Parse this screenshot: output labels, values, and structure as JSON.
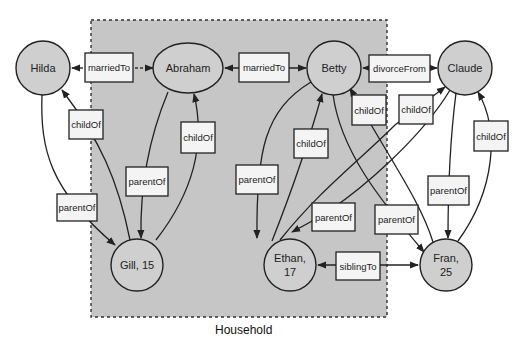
{
  "diagram": {
    "group": {
      "label": "Household",
      "fill": "#c6c6c6"
    },
    "node_fill": "#cfcfcf",
    "nodes": [
      {
        "id": "hilda",
        "lines": [
          "Hilda"
        ]
      },
      {
        "id": "abraham",
        "lines": [
          "Abraham"
        ]
      },
      {
        "id": "betty",
        "lines": [
          "Betty"
        ]
      },
      {
        "id": "claude",
        "lines": [
          "Claude"
        ]
      },
      {
        "id": "gill",
        "lines": [
          "Gill, 15"
        ]
      },
      {
        "id": "ethan",
        "lines": [
          "Ethan,",
          "17"
        ]
      },
      {
        "id": "fran",
        "lines": [
          "Fran,",
          "25"
        ]
      }
    ],
    "edges": [
      {
        "id": "e1",
        "from": "abraham",
        "to": "hilda",
        "label": "marriedTo",
        "style": "dashed",
        "bidirectional": true
      },
      {
        "id": "e2",
        "from": "abraham",
        "to": "betty",
        "label": "marriedTo",
        "style": "solid",
        "bidirectional": true
      },
      {
        "id": "e3",
        "from": "betty",
        "to": "claude",
        "label": "divorceFrom",
        "style": "solid",
        "bidirectional": true
      },
      {
        "id": "e4",
        "from": "gill",
        "to": "hilda",
        "label": "childOf"
      },
      {
        "id": "e5",
        "from": "hilda",
        "to": "gill",
        "label": "parentOf"
      },
      {
        "id": "e6",
        "from": "abraham",
        "to": "gill",
        "label": "parentOf"
      },
      {
        "id": "e7",
        "from": "gill",
        "to": "abraham",
        "label": "childOf"
      },
      {
        "id": "e8",
        "from": "betty",
        "to": "ethan",
        "label": "parentOf"
      },
      {
        "id": "e9",
        "from": "ethan",
        "to": "betty",
        "label": "childOf"
      },
      {
        "id": "e10",
        "from": "fran",
        "to": "betty",
        "label": "childOf"
      },
      {
        "id": "e11",
        "from": "ethan",
        "to": "claude",
        "label": "childOf"
      },
      {
        "id": "e12",
        "from": "claude",
        "to": "ethan",
        "label": "parentOf"
      },
      {
        "id": "e13",
        "from": "betty",
        "to": "fran",
        "label": "parentOf"
      },
      {
        "id": "e14",
        "from": "claude",
        "to": "fran",
        "label": "parentOf"
      },
      {
        "id": "e15",
        "from": "fran",
        "to": "claude",
        "label": "childOf"
      },
      {
        "id": "e16",
        "from": "ethan",
        "to": "fran",
        "label": "siblingTo",
        "style": "solid",
        "bidirectional": true
      }
    ]
  }
}
